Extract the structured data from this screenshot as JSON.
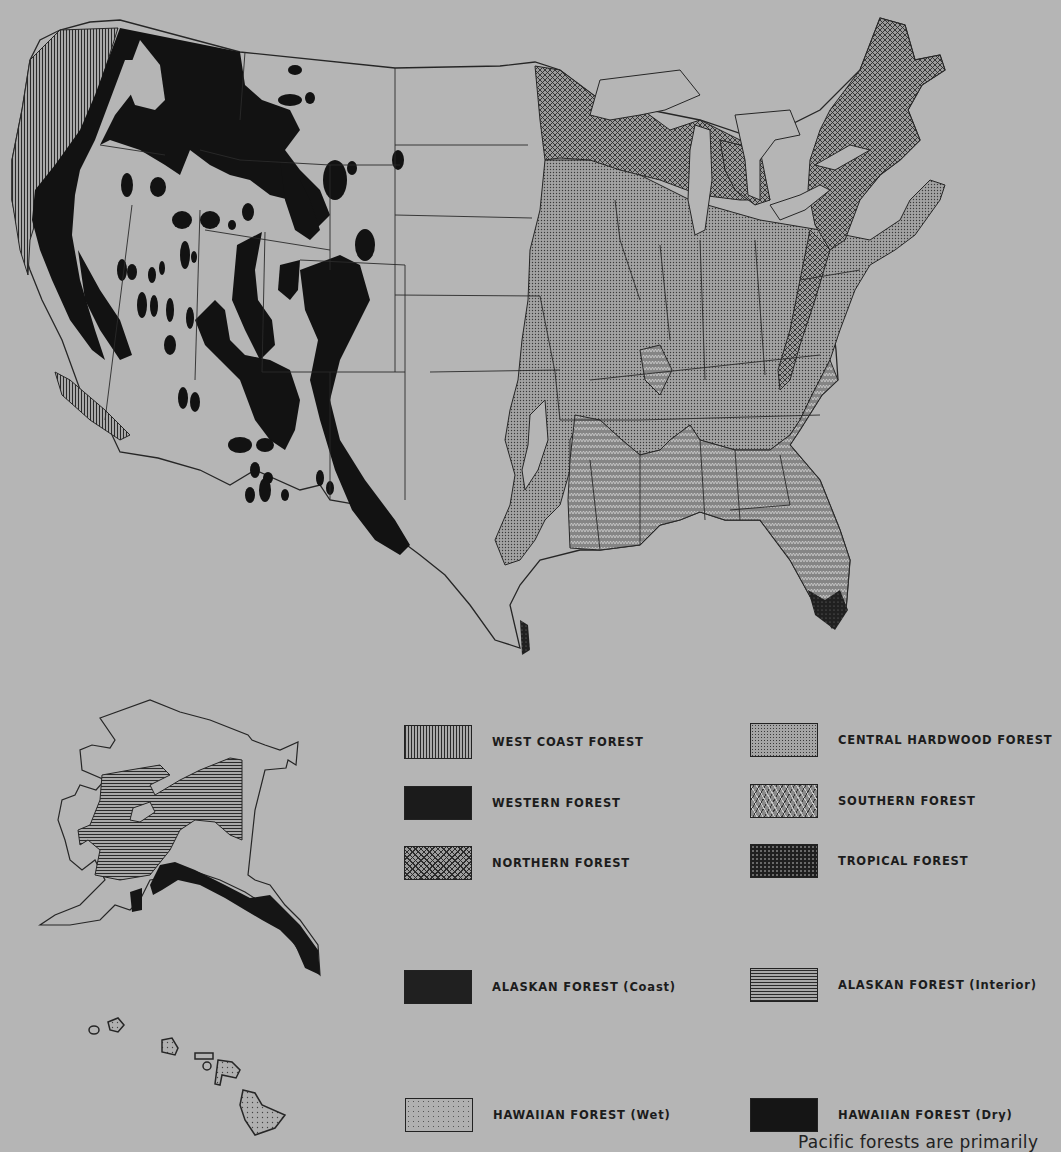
{
  "map": {
    "subject": "Forest regions of the United States",
    "insets": [
      "Alaska",
      "Hawaii"
    ],
    "background_color": "#b5b5b5"
  },
  "legend": {
    "items": [
      {
        "key": "west_coast",
        "label": "WEST COAST FOREST",
        "pattern": "vertical-lines"
      },
      {
        "key": "western",
        "label": "WESTERN FOREST",
        "pattern": "solid-black"
      },
      {
        "key": "northern",
        "label": "NORTHERN FOREST",
        "pattern": "crosshatch"
      },
      {
        "key": "central_hardwood",
        "label": "CENTRAL HARDWOOD FOREST",
        "pattern": "fine-dots"
      },
      {
        "key": "southern",
        "label": "SOUTHERN FOREST",
        "pattern": "zigzag"
      },
      {
        "key": "tropical",
        "label": "TROPICAL FOREST",
        "pattern": "dark-dots"
      },
      {
        "key": "alaskan_coast",
        "label": "ALASKAN FOREST (Coast)",
        "pattern": "solid-dark"
      },
      {
        "key": "alaskan_interior",
        "label": "ALASKAN FOREST (Interior)",
        "pattern": "horizontal-lines"
      },
      {
        "key": "hawaiian_wet",
        "label": "HAWAIIAN FOREST (Wet)",
        "pattern": "sparse-dots"
      },
      {
        "key": "hawaiian_dry",
        "label": "HAWAIIAN FOREST (Dry)",
        "pattern": "solid-black"
      }
    ]
  },
  "caption": {
    "text": "Pacific forests are primarily"
  }
}
